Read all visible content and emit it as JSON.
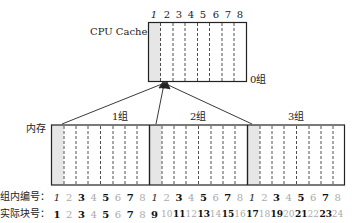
{
  "cache": {
    "label": "CPU Cache",
    "group_label": "0组",
    "slot_numbers": [
      "1",
      "2",
      "3",
      "4",
      "5",
      "6",
      "7",
      "8"
    ]
  },
  "memory": {
    "label": "内存",
    "groups": [
      {
        "label": "1组"
      },
      {
        "label": "2组"
      },
      {
        "label": "3组"
      }
    ]
  },
  "rows": {
    "group_index_label": "组内编号：",
    "block_index_label": "实际块号：",
    "group_index_values": [
      "1",
      "2",
      "3",
      "4",
      "5",
      "6",
      "7",
      "8",
      "1",
      "2",
      "3",
      "4",
      "5",
      "6",
      "7",
      "8",
      "1",
      "2",
      "3",
      "4",
      "5",
      "6",
      "7",
      "8"
    ],
    "block_index_values": [
      "1",
      "2",
      "3",
      "4",
      "5",
      "6",
      "7",
      "8",
      "9",
      "10",
      "11",
      "12",
      "13",
      "14",
      "15",
      "16",
      "17",
      "18",
      "19",
      "20",
      "21",
      "22",
      "23",
      "24"
    ]
  },
  "colors": {
    "shaded_slot": "#e6e6e6",
    "line": "#222222"
  }
}
